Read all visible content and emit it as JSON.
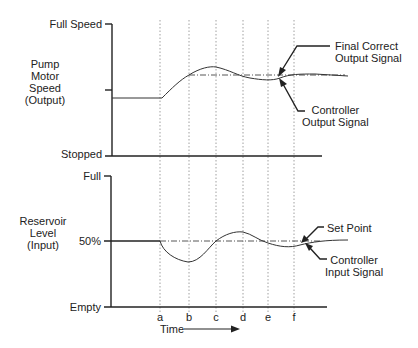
{
  "top_chart": {
    "y_axis_title": [
      "Pump",
      "Motor",
      "Speed",
      "(Output)"
    ],
    "y_max_label": "Full Speed",
    "y_min_label": "Stopped",
    "annotations": {
      "final_correct": [
        "Final Correct",
        "Output Signal"
      ],
      "controller_output": [
        "Controller",
        "Output Signal"
      ]
    }
  },
  "bottom_chart": {
    "y_axis_title": [
      "Reservoir",
      "Level",
      "(Input)"
    ],
    "y_max_label": "Full",
    "y_mid_label": "50%",
    "y_min_label": "Empty",
    "annotations": {
      "set_point": "Set Point",
      "controller_input": [
        "Controller",
        "Input Signal"
      ]
    }
  },
  "x_axis": {
    "title": "Time",
    "ticks": [
      "a",
      "b",
      "c",
      "d",
      "e",
      "f"
    ]
  },
  "colors": {
    "line": "#333333",
    "grid": "#777777"
  }
}
